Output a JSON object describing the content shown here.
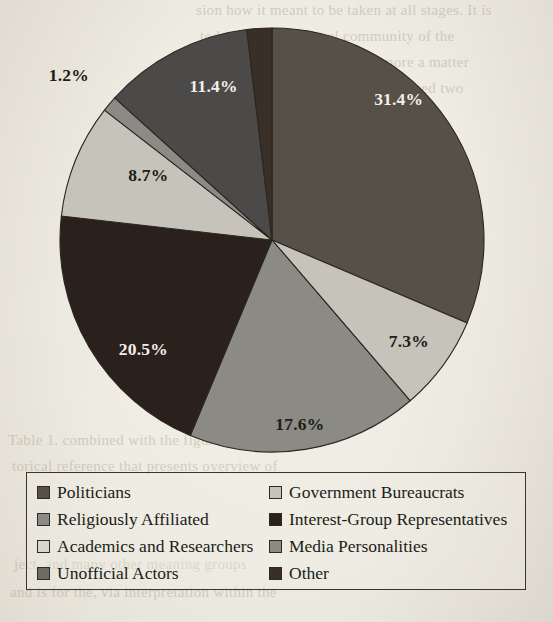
{
  "page": {
    "background_color": "#efece3",
    "ink_color": "#201c17"
  },
  "chart_data": {
    "type": "pie",
    "title": "",
    "subtitle": "",
    "xlabel": "",
    "ylabel": "",
    "legend_position": "bottom",
    "grid": false,
    "start_angle_deg": 0,
    "direction": "clockwise",
    "categories": [
      "Politicians",
      "Government Bureaucrats",
      "Religiously Affiliated",
      "Interest-Group Representatives",
      "Academics and Researchers",
      "Media Personalities",
      "Unofficial Actors",
      "Other"
    ],
    "values": [
      31.4,
      7.3,
      17.6,
      20.5,
      8.7,
      1.2,
      11.4,
      1.9
    ],
    "value_labels": [
      "31.4%",
      "7.3%",
      "17.6%",
      "20.5%",
      "8.7%",
      "1.2%",
      "11.4%",
      "1.9%"
    ],
    "colors": [
      "#565049",
      "#c6c3bb",
      "#8b8a84",
      "#2a211c",
      "#c6c3bb",
      "#8b8a84",
      "#4c4a48",
      "#3a2f27"
    ],
    "label_text_colors": [
      "#f2efe7",
      "#201c17",
      "#201c17",
      "#f2efe7",
      "#201c17",
      "#201c17",
      "#f2efe7",
      "#201c17"
    ],
    "slices": [
      {
        "name": "Politicians",
        "value": 31.4,
        "label": "31.4%",
        "color": "#565049",
        "label_color": "#f2efe7",
        "label_inside": true
      },
      {
        "name": "Government Bureaucrats",
        "value": 7.3,
        "label": "7.3%",
        "color": "#c6c3bb",
        "label_color": "#201c17",
        "label_inside": true
      },
      {
        "name": "Religiously Affiliated",
        "value": 17.6,
        "label": "17.6%",
        "color": "#8b8a84",
        "label_color": "#201c17",
        "label_inside": true
      },
      {
        "name": "Interest-Group Representatives",
        "value": 20.5,
        "label": "20.5%",
        "color": "#2a211c",
        "label_color": "#f2efe7",
        "label_inside": true
      },
      {
        "name": "Academics and Researchers",
        "value": 8.7,
        "label": "8.7%",
        "color": "#c6c3bb",
        "label_color": "#201c17",
        "label_inside": true
      },
      {
        "name": "Media Personalities",
        "value": 1.2,
        "label": "1.2%",
        "color": "#8b8a84",
        "label_color": "#201c17",
        "label_inside": false
      },
      {
        "name": "Unofficial Actors",
        "value": 11.4,
        "label": "11.4%",
        "color": "#4c4a48",
        "label_color": "#f2efe7",
        "label_inside": true
      },
      {
        "name": "Other",
        "value": 1.9,
        "label": "1.9%",
        "color": "#3a2f27",
        "label_color": "#201c17",
        "label_inside": false
      }
    ],
    "geometry": {
      "center_x": 272,
      "center_y": 240,
      "radius": 212,
      "stroke_color": "#2b2620",
      "stroke_width": 1.1
    }
  },
  "legend": {
    "border_color": "#3a352c",
    "columns": 2,
    "rows": 4,
    "items": [
      {
        "label": "Politicians",
        "color": "#565049",
        "column": 0,
        "row": 0
      },
      {
        "label": "Government Bureaucrats",
        "color": "#c6c3bb",
        "column": 1,
        "row": 0
      },
      {
        "label": "Religiously Affiliated",
        "color": "#8b8a84",
        "column": 0,
        "row": 1
      },
      {
        "label": "Interest-Group Representatives",
        "color": "#2a211c",
        "column": 1,
        "row": 1
      },
      {
        "label": "Academics and Researchers",
        "color": "#d9d6cd",
        "column": 0,
        "row": 2
      },
      {
        "label": "Media Personalities",
        "color": "#8b8a84",
        "column": 1,
        "row": 2
      },
      {
        "label": "Unofficial Actors",
        "color": "#6e6b65",
        "column": 0,
        "row": 3
      },
      {
        "label": "Other",
        "color": "#3a2f27",
        "column": 1,
        "row": 3
      }
    ]
  },
  "background_text": {
    "note": "faint bleed-through text from reverse of scanned page",
    "lines": [
      {
        "text": "sion how it meant to be taken at all stages. It is",
        "x": 196,
        "y": 2
      },
      {
        "text": "today the professional community of the",
        "x": 200,
        "y": 28
      },
      {
        "text": "weights, the interpretation is more a matter",
        "x": 198,
        "y": 54
      },
      {
        "text": "nounce the precise terms and proceed two",
        "x": 200,
        "y": 80
      },
      {
        "text": "are key points to consider and the more",
        "x": 196,
        "y": 106
      },
      {
        "text": "adding up, or with the opinion that are",
        "x": 200,
        "y": 132
      },
      {
        "text": "are definitive. In that manner this would",
        "x": 198,
        "y": 158
      },
      {
        "text": "that on them.",
        "x": 200,
        "y": 184
      },
      {
        "text": "Table 1. combined with the figures briefly the his-",
        "x": 8,
        "y": 432
      },
      {
        "text": "torical reference that presents overview of",
        "x": 12,
        "y": 458
      },
      {
        "text": "ject, and many other meaning groups",
        "x": 14,
        "y": 556
      },
      {
        "text": "and is for the, via interpretation within the",
        "x": 10,
        "y": 584
      }
    ]
  }
}
